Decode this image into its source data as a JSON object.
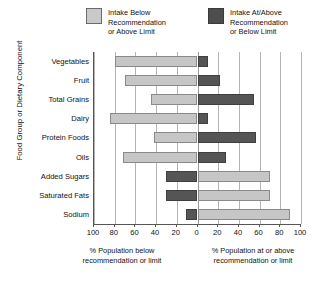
{
  "legend": {
    "items": [
      {
        "key": "below",
        "label": "Intake Below\nRecommendation\nor Above Limit",
        "color": "#c9c9c9",
        "swatch": "light-swatch-icon"
      },
      {
        "key": "atabove",
        "label": "Intake At/Above\nRecommendation\nor Below Limit",
        "color": "#4d4d4d",
        "swatch": "dark-swatch-icon"
      }
    ]
  },
  "axes": {
    "y_title": "Food Group or Dietary Component",
    "x_caption_left": "% Population below\nrecommendation or limit",
    "x_caption_right": "% Population at or above\nrecommendation or limit",
    "x_ticks": [
      "100",
      "80",
      "60",
      "40",
      "20",
      "0",
      "20",
      "40",
      "60",
      "80",
      "100"
    ]
  },
  "chart_data": {
    "type": "bar",
    "title": "",
    "subtitle": "",
    "orientation": "horizontal",
    "layout": "diverging-bidirectional",
    "xlabel_left": "% Population below recommendation or limit",
    "xlabel_right": "% Population at or above recommendation or limit",
    "ylabel": "Food Group or Dietary Component",
    "xlim": [
      -100,
      100
    ],
    "x_tick_values": [
      -100,
      -80,
      -60,
      -40,
      -20,
      0,
      20,
      40,
      60,
      80,
      100
    ],
    "x_tick_labels": [
      "100",
      "80",
      "60",
      "40",
      "20",
      "0",
      "20",
      "40",
      "60",
      "80",
      "100"
    ],
    "grid": true,
    "grid_axis": "x",
    "legend_position": "top",
    "categories": [
      "Vegetables",
      "Fruit",
      "Total Grains",
      "Dairy",
      "Protein Foods",
      "Oils",
      "Added Sugars",
      "Saturated Fats",
      "Sodium"
    ],
    "series": [
      {
        "name": "Intake Below Recommendation or Above Limit",
        "color": "#c9c9c9",
        "side": "mixed",
        "values": [
          80,
          70,
          45,
          85,
          42,
          72,
          70,
          70,
          89
        ]
      },
      {
        "name": "Intake At/Above Recommendation or Below Limit",
        "color": "#4d4d4d",
        "side": "mixed",
        "values": [
          10,
          22,
          55,
          10,
          57,
          28,
          30,
          30,
          11
        ]
      }
    ],
    "rows": [
      {
        "category": "Vegetables",
        "left_value": 80,
        "left_series": "below",
        "right_value": 10,
        "right_series": "atabove"
      },
      {
        "category": "Fruit",
        "left_value": 70,
        "left_series": "below",
        "right_value": 22,
        "right_series": "atabove"
      },
      {
        "category": "Total Grains",
        "left_value": 45,
        "left_series": "below",
        "right_value": 55,
        "right_series": "atabove"
      },
      {
        "category": "Dairy",
        "left_value": 85,
        "left_series": "below",
        "right_value": 10,
        "right_series": "atabove"
      },
      {
        "category": "Protein Foods",
        "left_value": 42,
        "left_series": "below",
        "right_value": 57,
        "right_series": "atabove"
      },
      {
        "category": "Oils",
        "left_value": 72,
        "left_series": "below",
        "right_value": 28,
        "right_series": "atabove"
      },
      {
        "category": "Added Sugars",
        "left_value": 30,
        "left_series": "atabove",
        "right_value": 70,
        "right_series": "below"
      },
      {
        "category": "Saturated Fats",
        "left_value": 30,
        "left_series": "atabove",
        "right_value": 70,
        "right_series": "below"
      },
      {
        "category": "Sodium",
        "left_value": 11,
        "left_series": "atabove",
        "right_value": 89,
        "right_series": "below"
      }
    ]
  }
}
